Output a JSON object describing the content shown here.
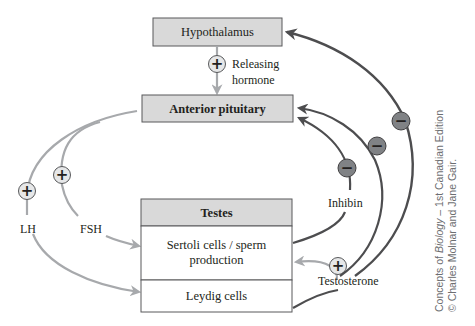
{
  "diagram": {
    "boxes": {
      "hypothalamus": "Hypothalamus",
      "anterior_pituitary": "Anterior pituitary",
      "testes": "Testes",
      "sertoli_line1": "Sertoli cells / sperm",
      "sertoli_line2": "production",
      "leydig": "Leydig cells"
    },
    "labels": {
      "releasing_line1": "Releasing",
      "releasing_line2": "hormone",
      "lh": "LH",
      "fsh": "FSH",
      "inhibin": "Inhibin",
      "testosterone": "Testosterone"
    },
    "symbols": {
      "plus": "+",
      "minus": "−"
    },
    "caption": {
      "line1_pre": "Concepts of ",
      "line1_italic": "Biology",
      "line1_post": " – 1st Canadian Edition",
      "line2": "© Charles Molnar and Jane Gair."
    },
    "colors": {
      "box_header_fill": "#d9d9d9",
      "box_body_fill": "#ffffff",
      "box_stroke": "#58595b",
      "stimulatory_arrow": "#a7a9ac",
      "inhibitory_arrow": "#4d4d4f",
      "plus_badge_fill": "#e6e7e8",
      "minus_badge_fill": "#808285"
    }
  }
}
